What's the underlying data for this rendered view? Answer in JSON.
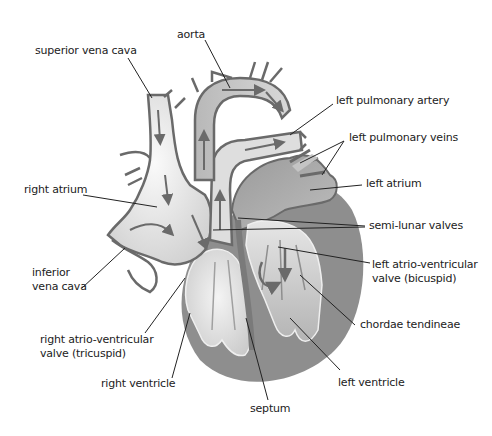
{
  "diagram": {
    "colors": {
      "background": "#ffffff",
      "vessel_light": "#e4e4e4",
      "vessel_mid": "#c4c4c4",
      "muscle_dark": "#8e8e8e",
      "chamber_left": "#b0b0b0",
      "outline": "#6a6a6a",
      "leader_line": "#222222",
      "label_text": "#222222"
    },
    "labels": {
      "superior_vena_cava": "superior vena cava",
      "aorta": "aorta",
      "left_pulmonary_artery": "left pulmonary artery",
      "left_pulmonary_veins": "left pulmonary veins",
      "right_atrium": "right atrium",
      "left_atrium": "left atrium",
      "semi_lunar_valves": "semi-lunar valves",
      "inferior_vena_cava_1": "inferior",
      "inferior_vena_cava_2": "vena cava",
      "left_av_valve_1": "left atrio-ventricular",
      "left_av_valve_2": "valve (bicuspid)",
      "right_av_valve_1": "right atrio-ventricular",
      "right_av_valve_2": "valve (tricuspid)",
      "chordae_tendineae": "chordae tendineae",
      "right_ventricle": "right ventricle",
      "left_ventricle": "left ventricle",
      "septum": "septum"
    }
  }
}
